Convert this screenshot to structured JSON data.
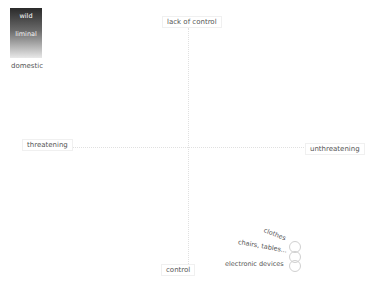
{
  "legend": {
    "title": "",
    "top_label": "wild",
    "mid_label": "liminal",
    "bottom_label": "domestic",
    "gradient_colors": [
      "#2a2a2a",
      "#6a6a6a",
      "#e8e8e8"
    ]
  },
  "axes": {
    "top": "lack of control",
    "bottom": "control",
    "left": "threatening",
    "right": "unthreatening"
  },
  "items": [
    {
      "label": "clothes",
      "quadrant": "bottom-right"
    },
    {
      "label": "chairs, tables...",
      "quadrant": "bottom-right"
    },
    {
      "label": "electronic devices",
      "quadrant": "bottom-right"
    }
  ]
}
